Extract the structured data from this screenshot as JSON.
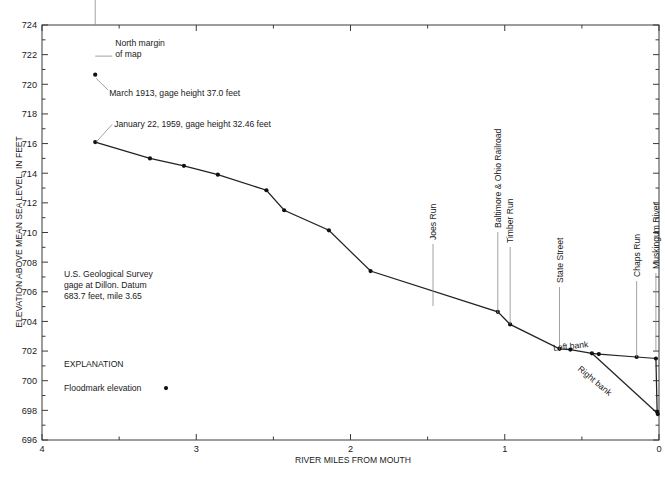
{
  "chart_data": {
    "type": "line",
    "title": "",
    "xlabel": "RIVER MILES FROM MOUTH",
    "ylabel": "ELEVATION ABOVE MEAN SEA LEVEL, IN FEET",
    "xlim": [
      4,
      0
    ],
    "ylim": [
      696,
      724
    ],
    "xticks": [
      4,
      3,
      2,
      1,
      0
    ],
    "xticklabels": [
      "4",
      "3",
      "2",
      "1",
      "0"
    ],
    "xminorticks": [
      3.5,
      2.5,
      1.5,
      0.5
    ],
    "yticks": [
      696,
      698,
      700,
      702,
      704,
      706,
      708,
      710,
      712,
      714,
      716,
      718,
      720,
      722,
      724
    ],
    "yticklabels": [
      "696",
      "698",
      "700",
      "702",
      "704",
      "706",
      "708",
      "710",
      "712",
      "714",
      "716",
      "718",
      "720",
      "722",
      "724"
    ],
    "yminorticks": [
      697,
      699,
      701,
      703,
      705,
      707,
      709,
      711,
      713,
      715,
      717,
      719,
      721,
      723
    ],
    "grid": false,
    "legend_position": "lower-left",
    "xaxis_inverted": true,
    "series": [
      {
        "name": "Left bank",
        "marker": "filled-circle",
        "points": [
          {
            "x": 3.655,
            "y": 716.1
          },
          {
            "x": 3.3,
            "y": 715.0
          },
          {
            "x": 3.08,
            "y": 714.5
          },
          {
            "x": 2.86,
            "y": 713.9
          },
          {
            "x": 2.545,
            "y": 712.85
          },
          {
            "x": 2.43,
            "y": 711.5
          },
          {
            "x": 2.14,
            "y": 710.15
          },
          {
            "x": 1.87,
            "y": 707.4
          },
          {
            "x": 1.045,
            "y": 704.65
          },
          {
            "x": 0.965,
            "y": 703.8
          },
          {
            "x": 0.645,
            "y": 702.15
          },
          {
            "x": 0.575,
            "y": 702.1
          },
          {
            "x": 0.435,
            "y": 701.85
          },
          {
            "x": 0.39,
            "y": 701.8
          },
          {
            "x": 0.145,
            "y": 701.6
          },
          {
            "x": 0.02,
            "y": 701.5
          },
          {
            "x": 0.012,
            "y": 697.9
          },
          {
            "x": 0.008,
            "y": 697.75
          }
        ]
      },
      {
        "name": "Right bank",
        "marker": "none",
        "points": [
          {
            "x": 0.435,
            "y": 701.85
          },
          {
            "x": 0.0,
            "y": 697.7
          }
        ]
      }
    ],
    "annotations": [
      {
        "name": "north-margin-of-map",
        "text": "North margin\nof map",
        "x": 3.655,
        "y": 722.0
      },
      {
        "name": "march-1913-floodmark",
        "text": "March 1913, gage height 37.0 feet",
        "x": 3.655,
        "y": 720.65
      },
      {
        "name": "january-1959-floodmark",
        "text": "January 22, 1959, gage height 32.46 feet",
        "x": 3.655,
        "y": 716.1
      },
      {
        "name": "usgs-gage-note",
        "text": "U.S. Geological Survey\ngage at Dillon.  Datum\n683.7 feet, mile 3.65",
        "x": 3.655,
        "y": 706.5
      }
    ],
    "feature_labels": [
      {
        "name": "joes-run",
        "text": "Joes Run",
        "x": 1.465
      },
      {
        "name": "baltimore-and-ohio-railroad",
        "text": "Baltimore & Ohio Railroad",
        "x": 1.045
      },
      {
        "name": "timber-run",
        "text": "Timber Run",
        "x": 0.965
      },
      {
        "name": "state-street",
        "text": "State Street",
        "x": 0.645
      },
      {
        "name": "chaps-run",
        "text": "Chaps Run",
        "x": 0.145
      },
      {
        "name": "muskingum-river",
        "text": "Muskingum River",
        "x": 0.02
      }
    ],
    "bank_labels": [
      {
        "name": "left-bank-label",
        "text": "Left bank"
      },
      {
        "name": "right-bank-label",
        "text": "Right bank"
      }
    ],
    "explanation": {
      "heading": "EXPLANATION",
      "items": [
        {
          "label": "Floodmark elevation",
          "marker": "filled-circle"
        }
      ]
    },
    "colors": {
      "profile_line": "#222222",
      "marker": "#111111",
      "axis": "#3a3a3a",
      "leader": "#8a8a8a",
      "text": "#1a1a1a",
      "background": "#ffffff"
    }
  }
}
